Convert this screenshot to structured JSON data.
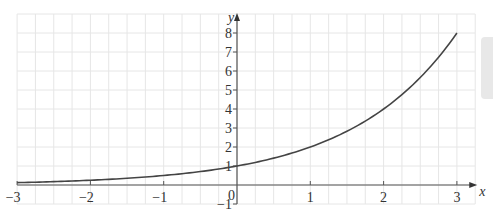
{
  "chart_data": {
    "type": "line",
    "title": "",
    "function": "y = 2^x",
    "xlabel": "x",
    "ylabel": "y",
    "xlim": [
      -3,
      3.25
    ],
    "ylim": [
      -1,
      9
    ],
    "x_ticks": [
      -3,
      -2,
      -1,
      1,
      2,
      3
    ],
    "y_ticks": [
      -1,
      1,
      2,
      3,
      4,
      5,
      6,
      7,
      8
    ],
    "origin_label": "0",
    "grid": {
      "x_step": 0.25,
      "y_step": 1
    },
    "series": [
      {
        "name": "2^x",
        "x": [
          -3,
          -2.5,
          -2,
          -1.5,
          -1,
          -0.5,
          0,
          0.5,
          1,
          1.5,
          2,
          2.5,
          3
        ],
        "y": [
          0.125,
          0.177,
          0.25,
          0.354,
          0.5,
          0.707,
          1,
          1.414,
          2,
          2.828,
          4,
          5.657,
          8
        ]
      }
    ],
    "colors": {
      "curve": "#444444",
      "axis": "#555555",
      "grid": "#e6e6e6"
    }
  }
}
